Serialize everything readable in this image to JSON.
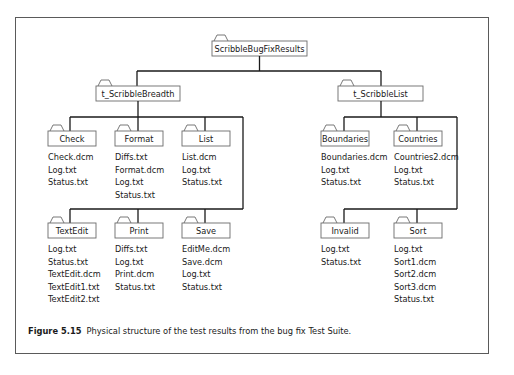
{
  "diagram": {
    "root": {
      "label": "ScribbleBugFixResults",
      "children": [
        {
          "label": "t_ScribbleBreadth",
          "children": [
            {
              "label": "Check",
              "files": [
                "Check.dcm",
                "Log.txt",
                "Status.txt"
              ]
            },
            {
              "label": "Format",
              "files": [
                "Diffs.txt",
                "Format.dcm",
                "Log.txt",
                "Status.txt"
              ]
            },
            {
              "label": "List",
              "files": [
                "List.dcm",
                "Log.txt",
                "Status.txt"
              ]
            },
            {
              "label": "TextEdit",
              "files": [
                "Log.txt",
                "Status.txt",
                "TextEdit.dcm",
                "TextEdit1.txt",
                "TextEdit2.txt"
              ]
            },
            {
              "label": "Print",
              "files": [
                "Diffs.txt",
                "Log.txt",
                "Print.dcm",
                "Status.txt"
              ]
            },
            {
              "label": "Save",
              "files": [
                "EditMe.dcm",
                "Save.dcm",
                "Log.txt",
                "Status.txt"
              ]
            }
          ]
        },
        {
          "label": "t_ScribbleList",
          "children": [
            {
              "label": "Boundaries",
              "files": [
                "Boundaries.dcm",
                "Log.txt",
                "Status.txt"
              ]
            },
            {
              "label": "Countries",
              "files": [
                "Countries2.dcm",
                "Log.txt",
                "Status.txt"
              ]
            },
            {
              "label": "Invalid",
              "files": [
                "Log.txt",
                "Status.txt"
              ]
            },
            {
              "label": "Sort",
              "files": [
                "Log.txt",
                "Sort1.dcm",
                "Sort2.dcm",
                "Sort3.dcm",
                "Status.txt"
              ]
            }
          ]
        }
      ]
    }
  },
  "caption": {
    "label": "Figure 5.15",
    "text": "Physical structure of the test results from the bug fix Test Suite."
  },
  "colors": {
    "line": "#1a1a1a",
    "folder_stroke": "#6a6a6a",
    "frame": "#5a5a5a"
  }
}
